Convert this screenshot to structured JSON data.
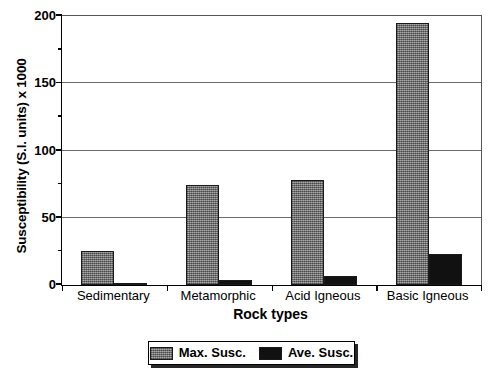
{
  "chart_data": {
    "type": "bar",
    "title": "",
    "xlabel": "Rock types",
    "ylabel": "Susceptibility (S.I. units) x 1000",
    "categories": [
      "Sedimentary",
      "Metamorphic",
      "Acid Igneous",
      "Basic Igneous"
    ],
    "series": [
      {
        "name": "Max. Susc.",
        "color": "#8b8b8b",
        "values": [
          25,
          74,
          78,
          195
        ]
      },
      {
        "name": "Ave. Susc.",
        "color": "#111111",
        "values": [
          1,
          4,
          7,
          23
        ]
      }
    ],
    "ylim": [
      0,
      200
    ],
    "ytick_labels": [
      "0",
      "50",
      "100",
      "150",
      "200"
    ],
    "ytick_values": [
      0,
      50,
      100,
      150,
      200
    ],
    "yminor_ticks": [
      25,
      75,
      125,
      175
    ],
    "gridlines": [
      50,
      100,
      150
    ],
    "grid": true,
    "legend_position": "bottom-center"
  },
  "legend": {
    "entries": [
      {
        "label": "Max. Susc."
      },
      {
        "label": "Ave. Susc."
      }
    ]
  }
}
